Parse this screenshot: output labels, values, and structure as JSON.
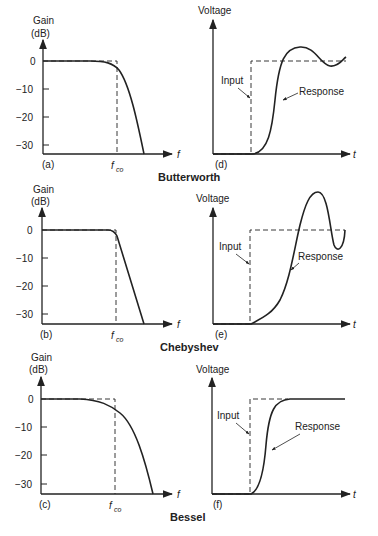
{
  "groups": [
    {
      "title": "Butterworth",
      "freq": {
        "panel": "(a)",
        "ylabel_1": "Gain",
        "ylabel_2": "(dB)",
        "xlabel": "f",
        "cutoff_label": "f",
        "cutoff_sub": "co",
        "yticks": [
          "0",
          "−10",
          "−20",
          "−30"
        ]
      },
      "step": {
        "panel": "(d)",
        "ylabel": "Voltage",
        "xlabel": "t",
        "input_label": "Input",
        "response_label": "Response"
      }
    },
    {
      "title": "Chebyshev",
      "freq": {
        "panel": "(b)",
        "ylabel_1": "Gain",
        "ylabel_2": "(dB)",
        "xlabel": "f",
        "cutoff_label": "f",
        "cutoff_sub": "co",
        "yticks": [
          "0",
          "−10",
          "−20",
          "−30"
        ]
      },
      "step": {
        "panel": "(e)",
        "ylabel": "Voltage",
        "xlabel": "t",
        "input_label": "Input",
        "response_label": "Response"
      }
    },
    {
      "title": "Bessel",
      "freq": {
        "panel": "(c)",
        "ylabel_1": "Gain",
        "ylabel_2": "(dB)",
        "xlabel": "f",
        "cutoff_label": "f",
        "cutoff_sub": "co",
        "yticks": [
          "0",
          "−10",
          "−20",
          "−30"
        ]
      },
      "step": {
        "panel": "(f)",
        "ylabel": "Voltage",
        "xlabel": "t",
        "input_label": "Input",
        "response_label": "Response"
      }
    }
  ],
  "colors": {
    "line": "#222222",
    "background": "#ffffff"
  }
}
